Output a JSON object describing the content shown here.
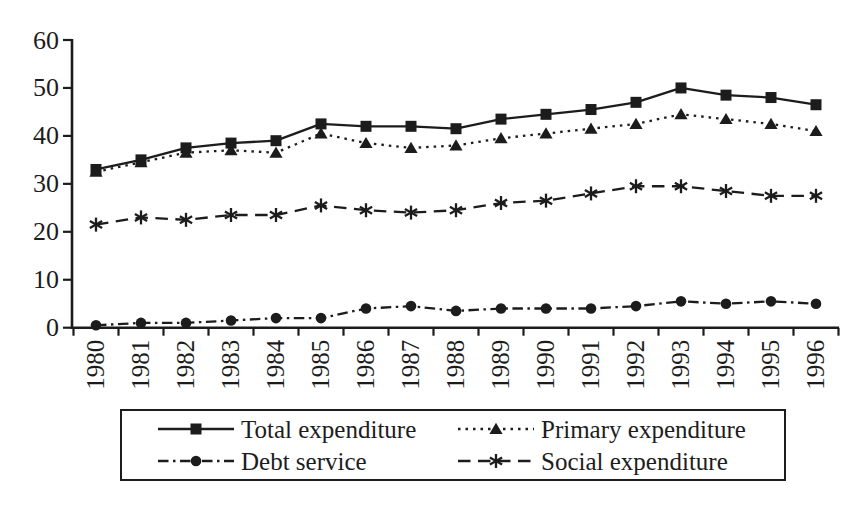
{
  "chart_data": {
    "type": "line",
    "title": "",
    "xlabel": "",
    "ylabel": "",
    "categories": [
      "1980",
      "1981",
      "1982",
      "1983",
      "1984",
      "1985",
      "1986",
      "1987",
      "1988",
      "1989",
      "1990",
      "1991",
      "1992",
      "1993",
      "1994",
      "1995",
      "1996"
    ],
    "series": [
      {
        "name": "Total expenditure",
        "marker": "square",
        "line": "solid",
        "values": [
          33,
          35,
          37.5,
          38.5,
          39,
          42.5,
          42,
          42,
          41.5,
          43.5,
          44.5,
          45.5,
          47,
          50,
          48.5,
          48,
          46.5
        ]
      },
      {
        "name": "Primary expenditure",
        "marker": "triangle",
        "line": "dotted",
        "values": [
          32.5,
          34.5,
          36.5,
          37,
          36.5,
          40.5,
          38.5,
          37.5,
          38,
          39.5,
          40.5,
          41.5,
          42.5,
          44.5,
          43.5,
          42.5,
          41
        ]
      },
      {
        "name": "Debt service",
        "marker": "circle",
        "line": "dashdot",
        "values": [
          0.5,
          1,
          1,
          1.5,
          2,
          2,
          4,
          4.5,
          3.5,
          4,
          4,
          4,
          4.5,
          5.5,
          5,
          5.5,
          5
        ]
      },
      {
        "name": "Social expenditure",
        "marker": "star",
        "line": "dashed",
        "values": [
          21.5,
          23,
          22.5,
          23.5,
          23.5,
          25.5,
          24.5,
          24,
          24.5,
          26,
          26.5,
          28,
          29.5,
          29.5,
          28.5,
          27.5,
          27.5
        ]
      }
    ],
    "ylim": [
      0,
      60
    ],
    "yticks": [
      0,
      10,
      20,
      30,
      40,
      50,
      60
    ],
    "grid": false,
    "legend_position": "bottom-box",
    "colors": {
      "ink": "#1c1c1c",
      "background": "#ffffff"
    }
  }
}
